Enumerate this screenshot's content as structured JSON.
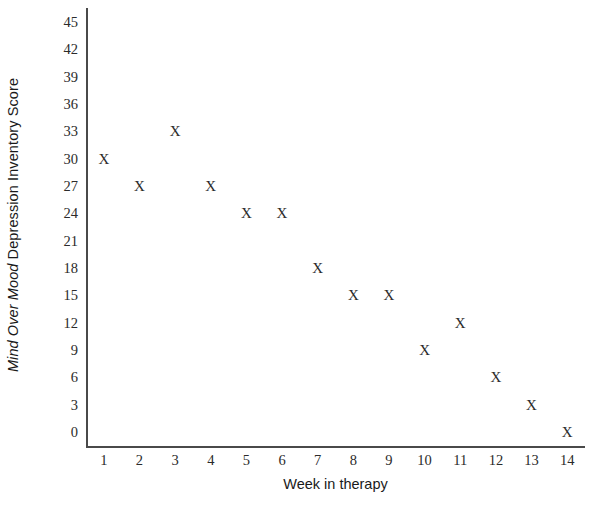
{
  "chart_data": {
    "type": "scatter",
    "title": "",
    "xlabel": "Week in therapy",
    "ylabel": "Mind Over Mood Depression Inventory Score",
    "ylabel_italic_part": "Mind Over Mood",
    "ylabel_regular_part": " Depression Inventory Score",
    "marker": "X",
    "grid": false,
    "legend": null,
    "xlim": [
      0.5,
      14.5
    ],
    "ylim": [
      0,
      45
    ],
    "xticks": [
      1,
      2,
      3,
      4,
      5,
      6,
      7,
      8,
      9,
      10,
      11,
      12,
      13,
      14
    ],
    "xtick_labels": [
      "1",
      "2",
      "3",
      "4",
      "5",
      "6",
      "7",
      "8",
      "9",
      "10",
      "11",
      "12",
      "13",
      "14"
    ],
    "yticks": [
      0,
      3,
      6,
      9,
      12,
      15,
      18,
      21,
      24,
      27,
      30,
      33,
      36,
      39,
      42,
      45
    ],
    "ytick_labels": [
      "0",
      "3",
      "6",
      "9",
      "12",
      "15",
      "18",
      "21",
      "24",
      "27",
      "30",
      "33",
      "36",
      "39",
      "42",
      "45"
    ],
    "x": [
      1,
      2,
      3,
      4,
      5,
      6,
      7,
      8,
      9,
      10,
      11,
      12,
      13,
      14
    ],
    "values": [
      30,
      27,
      33,
      27,
      24,
      24,
      18,
      15,
      15,
      9,
      12,
      6,
      3,
      0
    ],
    "points": [
      {
        "x": 1,
        "y": 30
      },
      {
        "x": 2,
        "y": 27
      },
      {
        "x": 3,
        "y": 33
      },
      {
        "x": 4,
        "y": 27
      },
      {
        "x": 5,
        "y": 24
      },
      {
        "x": 6,
        "y": 24
      },
      {
        "x": 7,
        "y": 18
      },
      {
        "x": 8,
        "y": 15
      },
      {
        "x": 9,
        "y": 15
      },
      {
        "x": 10,
        "y": 9
      },
      {
        "x": 11,
        "y": 12
      },
      {
        "x": 12,
        "y": 6
      },
      {
        "x": 13,
        "y": 3
      },
      {
        "x": 14,
        "y": 0
      }
    ],
    "colors": {
      "background": "#ffffff",
      "axis": "#4a4a4a",
      "text": "#2b2b2b",
      "marker": "#2b2b2b"
    }
  }
}
